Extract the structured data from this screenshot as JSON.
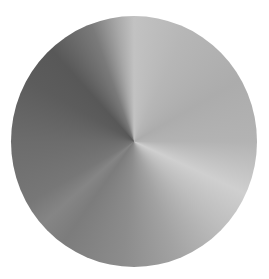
{
  "image": {
    "description": "Brushed metal conic-gradient disc",
    "shape": "circle",
    "colors": {
      "background": "#ffffff",
      "lightest": "#cfcfcf",
      "darkest": "#585858"
    }
  }
}
